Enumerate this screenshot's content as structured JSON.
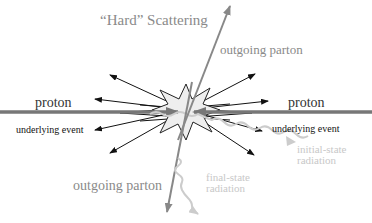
{
  "diagram": {
    "title": "“Hard” Scattering",
    "labels": {
      "outgoing_parton_top": "outgoing parton",
      "outgoing_parton_bottom": "outgoing parton",
      "proton_left": "proton",
      "proton_right": "proton",
      "underlying_event_left": "underlying event",
      "underlying_event_right": "underlying event",
      "initial_state_radiation_line1": "initial-state",
      "initial_state_radiation_line2": "radiation",
      "final_state_radiation_line1": "final-state",
      "final_state_radiation_line2": "radiation"
    },
    "colors": {
      "proton_beam": "#777777",
      "parton": "#888888",
      "underlying_event_arrows": "#111111",
      "radiation": "#cccccc",
      "star_fill": "#eeeeee",
      "star_stroke": "#222222"
    }
  }
}
